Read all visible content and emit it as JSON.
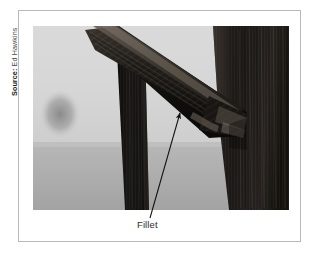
{
  "figure": {
    "source_label": "Source:",
    "source_name": "Ed Hawkins",
    "callout_label": "Fillet",
    "photo_alt": "Close-up grayscale photograph of a wooden furniture joint showing a diagonal brace meeting a vertical leg, with a fillet at the junction",
    "colors": {
      "card_border": "#b9b9b9",
      "page_background": "#ffffff",
      "annotation_line": "#111111",
      "label_text": "#2b2b2b",
      "source_text": "#3d3d3d",
      "photo_sky": "#d8d8d8",
      "photo_floor": "#b5b5b5",
      "photo_wood_dark": "#171717",
      "photo_wood_mid": "#2e2b28",
      "photo_wood_light": "#4a443e"
    }
  }
}
